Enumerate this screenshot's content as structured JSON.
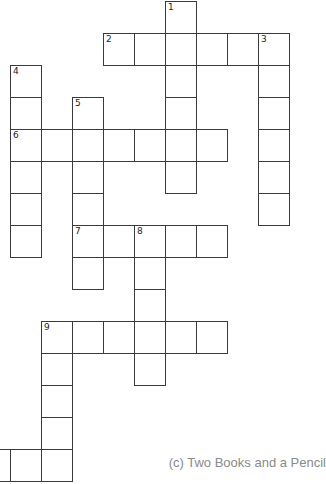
{
  "puzzle": {
    "type": "crossword",
    "credit": "(c) Two Books and a Pencil",
    "cell_size_px": 31,
    "origin": {
      "x": 10,
      "y": 1,
      "row_height": 32
    },
    "entries": [
      {
        "number": "1",
        "direction": "down",
        "row": 0,
        "col": 5,
        "length": 6
      },
      {
        "number": "2",
        "direction": "across",
        "row": 1,
        "col": 3,
        "length": 6
      },
      {
        "number": "3",
        "direction": "down",
        "row": 1,
        "col": 8,
        "length": 6
      },
      {
        "number": "4",
        "direction": "down",
        "row": 2,
        "col": 0,
        "length": 6
      },
      {
        "number": "5",
        "direction": "down",
        "row": 3,
        "col": 2,
        "length": 6
      },
      {
        "number": "6",
        "direction": "across",
        "row": 4,
        "col": 0,
        "length": 7
      },
      {
        "number": "7",
        "direction": "across",
        "row": 7,
        "col": 2,
        "length": 5
      },
      {
        "number": "8",
        "direction": "down",
        "row": 7,
        "col": 4,
        "length": 5
      },
      {
        "number": "9",
        "direction": "across",
        "row": 10,
        "col": 1,
        "length": 6
      },
      {
        "number": "9",
        "direction": "down",
        "row": 10,
        "col": 1,
        "length": 5
      },
      {
        "number": "",
        "direction": "across",
        "row": 14,
        "col": -1,
        "length": 3
      }
    ]
  }
}
